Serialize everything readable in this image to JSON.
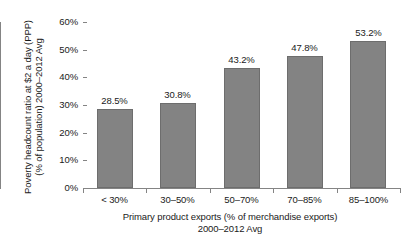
{
  "chart_data": {
    "type": "bar",
    "title": "",
    "categories": [
      "< 30%",
      "30–50%",
      "50–70%",
      "70–85%",
      "85–100%"
    ],
    "values": [
      28.5,
      30.8,
      43.2,
      47.8,
      53.2
    ],
    "value_labels": [
      "28.5%",
      "30.8%",
      "43.2%",
      "47.8%",
      "53.2%"
    ],
    "xlabel": "Primary product exports (% of merchandise exports)",
    "xlabel_line2": "2000–2012 Avg",
    "ylabel": "Poverty headcount ratio at $2 a day (PPP)",
    "ylabel_line2": "(% of population) 2000–2012 Avg",
    "ylim": [
      0,
      60
    ],
    "ytick_values": [
      0,
      10,
      20,
      30,
      40,
      50,
      60
    ],
    "ytick_labels": [
      "0%",
      "10%",
      "20%",
      "30%",
      "40%",
      "50%",
      "60%"
    ],
    "grid": false,
    "legend": false,
    "legend_position": "none",
    "series_color": "#838383",
    "series_border_color": "#6d6d6d",
    "axis_color": "#848484",
    "text_color": "#1a1a1a",
    "background_color": "#ffffff"
  }
}
